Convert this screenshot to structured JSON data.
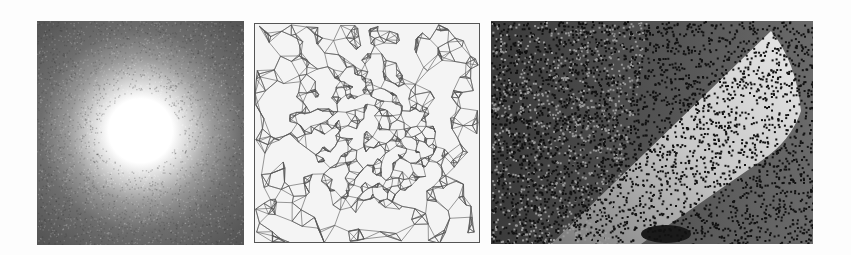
{
  "figure": {
    "panels": [
      {
        "id": "p1",
        "description": "noisy radial intensity image with bright central disk",
        "colors": {
          "center": "#ffffff",
          "edge": "#4d4d4d"
        }
      },
      {
        "id": "p2",
        "description": "triangulated mesh, denser toward center",
        "colors": {
          "line": "#555555",
          "background": "#f4f4f4"
        }
      },
      {
        "id": "p3",
        "description": "noisy rendering of shaded curved wedge surface",
        "colors": {
          "background": "#5c5c5c",
          "surface_light": "#d8d8d8",
          "noise": "#111111"
        }
      }
    ]
  }
}
